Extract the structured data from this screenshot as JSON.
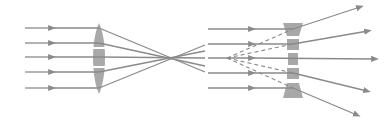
{
  "diagram": {
    "colors": {
      "ray": "#8a8a8a",
      "lens": "#9a9a9a",
      "background": "#ffffff"
    },
    "converging": {
      "label": "converging-lens",
      "lens_x": 99,
      "focal_point": [
        175,
        58
      ],
      "ray_start_x": 25,
      "ray_ys": [
        28,
        43,
        57,
        72,
        88
      ],
      "arrow_x": 50
    },
    "diverging": {
      "label": "diverging-lens",
      "lens_x": 293,
      "virtual_focal_point": [
        227,
        58
      ],
      "ray_start_x": 208,
      "ray_ys": [
        29,
        44,
        58,
        73,
        88
      ],
      "arrow_x": 250,
      "ray_ends": [
        [
          360,
          7
        ],
        [
          368,
          31
        ],
        [
          375,
          59
        ],
        [
          367,
          91
        ],
        [
          357,
          115
        ]
      ]
    }
  }
}
